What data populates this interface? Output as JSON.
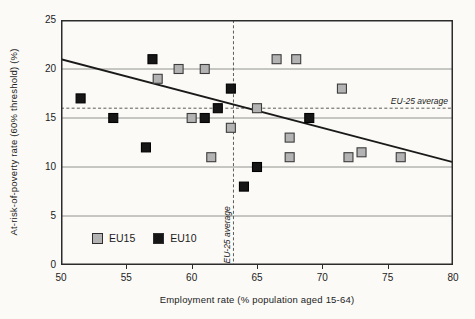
{
  "figure": {
    "background": "#fbfaf6",
    "frame_color": "#2b2b2b",
    "gridline_color": "#777777",
    "trend_color": "#1a1a1a",
    "dash_color": "#4a4a4a"
  },
  "chart_data": {
    "type": "scatter",
    "title": "",
    "xlabel": "Employment rate (% population aged 15-64)",
    "ylabel": "At-risk-of-poverty rate (60% threshold) (%)",
    "xlim": [
      50,
      80
    ],
    "ylim": [
      0,
      25
    ],
    "x_ticks": [
      50,
      55,
      60,
      65,
      70,
      75,
      80
    ],
    "y_ticks": [
      0,
      5,
      10,
      15,
      20,
      25
    ],
    "gridlines_y": [
      5,
      10,
      15,
      20
    ],
    "grid": "horizontal-only",
    "legend_position": "inside-bottom-left",
    "series": [
      {
        "name": "EU15",
        "color": "#b3b3b3",
        "border": "#3c3c3c",
        "points": [
          [
            57.4,
            19
          ],
          [
            59,
            20
          ],
          [
            61,
            20
          ],
          [
            60,
            15
          ],
          [
            61.5,
            11
          ],
          [
            63,
            14
          ],
          [
            65,
            16
          ],
          [
            66.5,
            21
          ],
          [
            68,
            21
          ],
          [
            67.5,
            13
          ],
          [
            67.5,
            11
          ],
          [
            71.5,
            18
          ],
          [
            72,
            11
          ],
          [
            73,
            11.5
          ],
          [
            76,
            11
          ]
        ]
      },
      {
        "name": "EU10",
        "color": "#161616",
        "border": "#000000",
        "points": [
          [
            51.5,
            17
          ],
          [
            54,
            15
          ],
          [
            57,
            21
          ],
          [
            56.5,
            12
          ],
          [
            61,
            15
          ],
          [
            62,
            16
          ],
          [
            63,
            18
          ],
          [
            64,
            8
          ],
          [
            65,
            10
          ],
          [
            69,
            15
          ]
        ]
      }
    ],
    "trend_line": {
      "x1": 50,
      "y1": 21,
      "x2": 80,
      "y2": 10.5
    },
    "reference_lines": {
      "horizontal": {
        "value": 16,
        "label": "EU-25 average"
      },
      "vertical": {
        "value": 63.2,
        "label": "EU-25 average"
      }
    }
  }
}
